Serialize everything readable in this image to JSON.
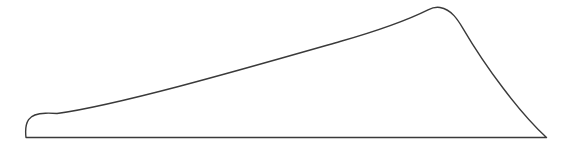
{
  "figure": {
    "name": "wing-planform-outline",
    "kind": "line-drawing",
    "width": 570,
    "height": 150,
    "background_color": "#ffffff",
    "stroke_color": "#3a3a3a",
    "stroke_width": 1.4,
    "fill": "none",
    "labels": [],
    "annotations": [],
    "shape": {
      "closed": true,
      "vertices": {
        "bottom_left_root": [
          26,
          137.5
        ],
        "left_tip_top": [
          57,
          113.5
        ],
        "apex_crest": [
          440,
          7.5
        ],
        "apex_shoulder": [
          461,
          13.5
        ],
        "bottom_right_tip": [
          546.5,
          137.5
        ]
      },
      "path": "M 26 137.5 C 25.2 130.5 25.6 124.0 28.6 119.6 C 31.6 115.2 37.8 113.4 45.5 113.2 C 49.5 113.1 53.2 113.2 57.0 113.5 C 120.0 104.6 240.0 70.0 340.0 41.5 C 380.0 30.0 412.0 17.8 428.0 9.8 C 432.5 7.6 436.4 6.9 440.0 7.5 C 445.2 8.4 449.8 11.0 454.0 15.6 C 457.3 19.2 460.0 23.4 462.6 27.8 C 486.0 67.6 519.0 112.0 546.5 137.5 L 26 137.5 Z"
    }
  }
}
